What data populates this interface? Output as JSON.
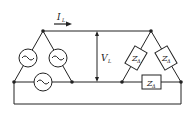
{
  "diagram": {
    "current_label": {
      "main": "I",
      "sub": "L"
    },
    "voltage_label": {
      "main": "V",
      "sub": "L"
    },
    "impedance_label": {
      "main": "Z",
      "sub": "Δ",
      "dot": "·"
    },
    "sources": [
      {
        "id": "source-left",
        "symbol": "~"
      },
      {
        "id": "source-right",
        "symbol": "~"
      },
      {
        "id": "source-bottom",
        "symbol": "~"
      }
    ],
    "loads": [
      {
        "id": "load-left"
      },
      {
        "id": "load-right"
      },
      {
        "id": "load-bottom"
      }
    ],
    "colors": {
      "line": "#222222",
      "background": "#ffffff"
    }
  }
}
